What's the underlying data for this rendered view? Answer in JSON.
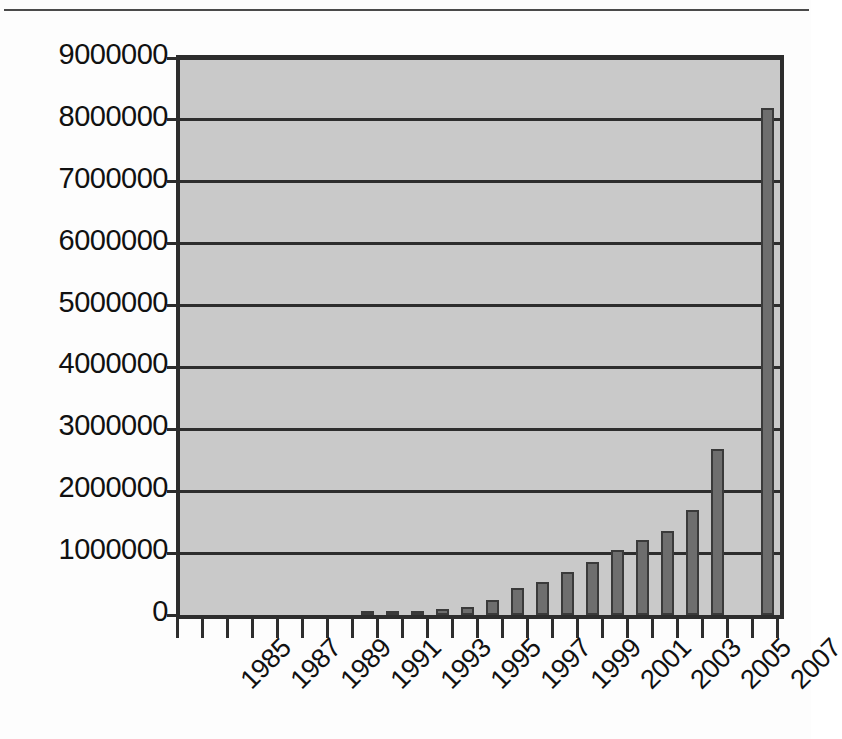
{
  "chart_data": {
    "type": "bar",
    "title": "",
    "subtitle": "",
    "xlabel": "",
    "ylabel": "",
    "ylim": [
      0,
      9000000
    ],
    "ytick_values": [
      0,
      1000000,
      2000000,
      3000000,
      4000000,
      5000000,
      6000000,
      7000000,
      8000000,
      9000000
    ],
    "ytick_labels": [
      "0",
      "1000000",
      "2000000",
      "3000000",
      "4000000",
      "5000000",
      "6000000",
      "7000000",
      "8000000",
      "9000000"
    ],
    "grid": true,
    "legend": false,
    "legend_position": "none",
    "categories": [
      "1985",
      "1986",
      "1987",
      "1988",
      "1989",
      "1990",
      "1991",
      "1992",
      "1993",
      "1994",
      "1995",
      "1996",
      "1997",
      "1998",
      "1999",
      "2000",
      "2001",
      "2002",
      "2003",
      "2004",
      "2005",
      "2006",
      "2007",
      "2008"
    ],
    "xtick_labels_shown": [
      "1985",
      "1987",
      "1989",
      "1991",
      "1993",
      "1995",
      "1997",
      "1999",
      "2001",
      "2003",
      "2005",
      "2007"
    ],
    "values": [
      0,
      0,
      0,
      0,
      0,
      0,
      0,
      10000,
      40000,
      60000,
      90000,
      130000,
      250000,
      430000,
      530000,
      700000,
      860000,
      1050000,
      1220000,
      1350000,
      1700000,
      2680000,
      0,
      8200000
    ],
    "series": [
      {
        "name": "count",
        "values": [
          0,
          0,
          0,
          0,
          0,
          0,
          0,
          10000,
          40000,
          60000,
          90000,
          130000,
          250000,
          430000,
          530000,
          700000,
          860000,
          1050000,
          1220000,
          1350000,
          1700000,
          2680000,
          0,
          8200000
        ]
      }
    ],
    "colors": {
      "bar_fill": "#6e6e6e",
      "bar_edge": "#3a3a3a",
      "plot_background": "#c9c9c9",
      "gridline": "#2d2d2d",
      "axis": "#2d2d2d",
      "text": "#111111",
      "figure_background": "#fdfdfd"
    }
  }
}
